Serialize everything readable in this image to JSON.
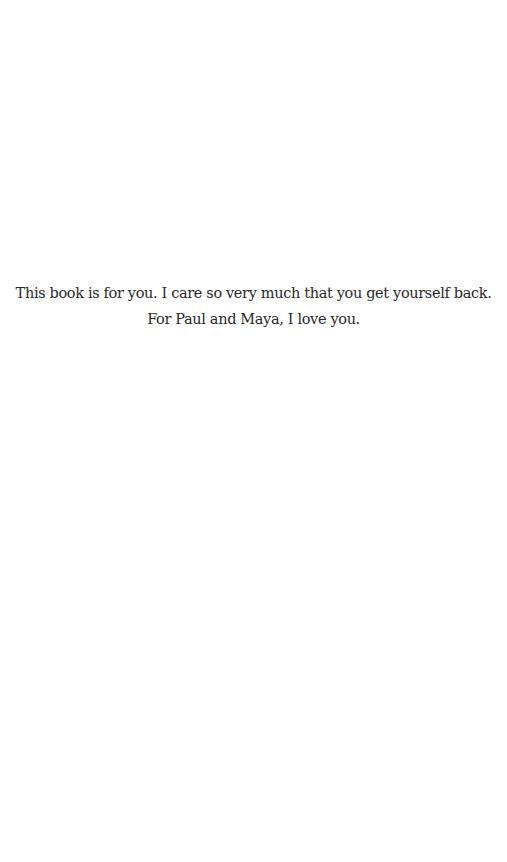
{
  "page": {
    "background_color": "#ffffff",
    "text_color": "#2a2a2a"
  },
  "dedication": {
    "lines": [
      "This book is for you. I care so very much that you get yourself back.",
      "For Paul and Maya, I love you."
    ]
  }
}
